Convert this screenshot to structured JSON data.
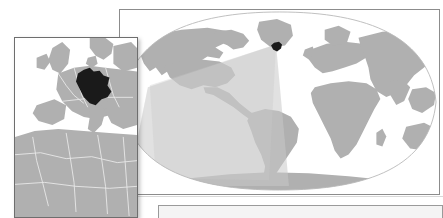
{
  "figure": {
    "subject_country": "Germany",
    "projection": "Robinson",
    "background_color": "#ffffff"
  },
  "colors": {
    "land": "#b0b0b0",
    "land_shaded": "#9a9a9a",
    "highlight_country": "#1a1a1a",
    "ocean": "#ffffff",
    "border_line": "#e8e8e8",
    "graticule_outline": "#b8b8b8",
    "panel_border": "#8c8c8c",
    "inset_border": "#6e6e6e",
    "wedge_overlay": "#c9c9c9",
    "caption_bar_fill": "#f4f4f4"
  },
  "world_map": {
    "name": "world-locator-map",
    "projection_label": "Robinson",
    "highlight_marker": {
      "label": "Germany",
      "x_pct": 49.0,
      "y_pct": 19.0
    },
    "wedge": {
      "label": "coverage-cone",
      "apex_x_pct": 49.0,
      "apex_y_pct": 19.0,
      "opacity": 0.55
    }
  },
  "inset_map": {
    "name": "europe-inset-map",
    "region_label": "Western Europe and North Africa",
    "highlight_country": "Germany"
  },
  "caption": {
    "text": ""
  }
}
